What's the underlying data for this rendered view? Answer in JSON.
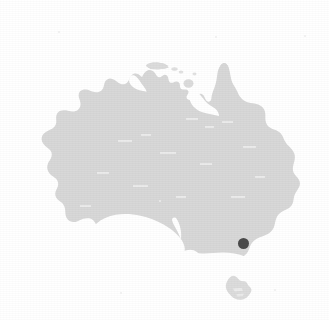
{
  "figure": {
    "kind": "locality-map",
    "region_name": "Australia",
    "width": 329,
    "height": 320,
    "background_color": "#ffffff",
    "has_labels": false,
    "has_border": false,
    "has_graticule": false,
    "has_scale_bar": false,
    "has_legend": false,
    "has_north_arrow": false,
    "caption": ""
  },
  "chart_data": {
    "type": "map",
    "title": "",
    "projection_note": "unprojected outline silhouette",
    "landmasses": [
      {
        "name": "Australia mainland",
        "fill": "#d8d8d8",
        "bbox_px": [
          33,
          57,
          305,
          266
        ]
      },
      {
        "name": "Tasmania",
        "fill": "#dcdcdc",
        "bbox_px": [
          225,
          274,
          252,
          301
        ]
      },
      {
        "name": "Melville Island",
        "fill": "#dcdcdc",
        "bbox_px": [
          146,
          62,
          170,
          70
        ]
      },
      {
        "name": "Groote Eylandt",
        "fill": "#dcdcdc",
        "bbox_px": [
          183,
          78,
          193,
          88
        ]
      }
    ],
    "markers": [
      {
        "label": "",
        "shape": "filled-circle",
        "color": "#4a4a4a",
        "radius_px": 5.5,
        "x_px": 243.5,
        "y_px": 243.5,
        "approx_locality": "south-eastern Australia (Victoria)"
      }
    ],
    "legend_entries": [],
    "annotations": []
  },
  "colors": {
    "land_gray": "#d8d8d8",
    "land_gray_edge": "#dcdcdc",
    "marker_dark": "#4a4a4a",
    "paper_white": "#ffffff",
    "speck_gray": "#ededed"
  },
  "specks": [
    {
      "x": 58,
      "y": 31,
      "d": 2
    },
    {
      "x": 215,
      "y": 36,
      "d": 2
    },
    {
      "x": 304,
      "y": 35,
      "d": 2
    },
    {
      "x": 159,
      "y": 200,
      "d": 2
    },
    {
      "x": 274,
      "y": 289,
      "d": 2
    },
    {
      "x": 120,
      "y": 292,
      "d": 2
    }
  ]
}
